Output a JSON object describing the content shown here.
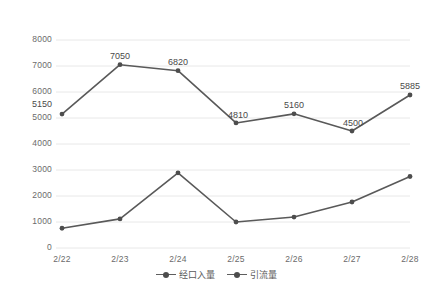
{
  "chart_data": {
    "type": "line",
    "title": "",
    "xlabel": "",
    "ylabel": "",
    "categories": [
      "2/22",
      "2/23",
      "2/24",
      "2/25",
      "2/26",
      "2/27",
      "2/28"
    ],
    "ylim": [
      0,
      8000
    ],
    "yticks": [
      0,
      1000,
      2000,
      3000,
      4000,
      5000,
      6000,
      7000,
      8000
    ],
    "ytick_labels": [
      "0",
      "1000",
      "2000",
      "3000",
      "4000",
      "5000",
      "6000",
      "7000",
      "8000"
    ],
    "grid": true,
    "legend_position": "bottom",
    "series": [
      {
        "name": "经口入量",
        "color": "#595959",
        "values": [
          5150,
          7050,
          6820,
          4810,
          5160,
          4500,
          5885
        ],
        "labels": [
          "5150",
          "7050",
          "6820",
          "4810",
          "5160",
          "4500",
          "5885"
        ],
        "show_labels": true
      },
      {
        "name": "引流量",
        "color": "#595959",
        "values": [
          760,
          1120,
          2890,
          1000,
          1190,
          1770,
          2750
        ],
        "labels": [
          "760",
          "1120",
          "2890",
          "1000",
          "1190",
          "1770",
          "2750"
        ],
        "show_labels": false
      }
    ]
  },
  "axis": {
    "x_tick_labels": [
      "2/22",
      "2/23",
      "2/24",
      "2/25",
      "2/26",
      "2/27",
      "2/28"
    ],
    "y_tick_labels": [
      "8000",
      "7000",
      "6000",
      "5000",
      "4000",
      "3000",
      "2000",
      "1000",
      "0"
    ]
  },
  "legend": {
    "items": [
      {
        "label": "经口入量"
      },
      {
        "label": "引流量"
      }
    ]
  },
  "data_labels": {
    "series1": [
      "5150",
      "7050",
      "6820",
      "4810",
      "5160",
      "4500",
      "5885"
    ]
  },
  "colors": {
    "line": "#595959",
    "marker": "#4d4d4d",
    "grid": "#e8e8e8",
    "tick_text": "#6b6b6b",
    "label_text": "#4a4a4a",
    "background": "#ffffff"
  }
}
